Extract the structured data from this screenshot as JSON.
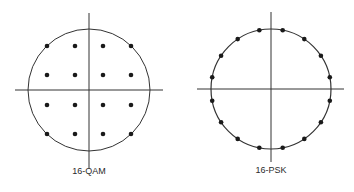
{
  "diagrams": [
    {
      "id": "qam",
      "label": "16-QAM",
      "center": [
        89,
        90
      ],
      "radius": 61,
      "axis_h": [
        15,
        163
      ],
      "axis_v": [
        13,
        168
      ],
      "label_pos": [
        89,
        174
      ],
      "grid_x": [
        47,
        75,
        103,
        131
      ],
      "grid_y": [
        46,
        75,
        105,
        134
      ]
    },
    {
      "id": "psk",
      "label": "16-PSK",
      "center": [
        271,
        89
      ],
      "radius": 60,
      "axis_h": [
        197,
        344
      ],
      "axis_v": [
        12,
        162
      ],
      "label_pos": [
        271,
        173
      ],
      "num_points": 16,
      "phase_offset_deg": 11.25
    }
  ],
  "colors": {
    "line": "#333333",
    "dot": "#1a1a1a"
  }
}
